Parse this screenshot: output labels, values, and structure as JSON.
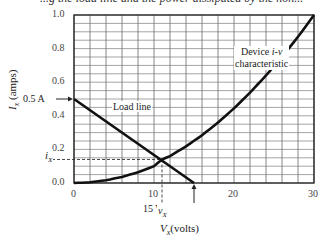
{
  "caption_fragment": "...g the load line and the power dissipated by the non...",
  "chart_data": {
    "type": "line",
    "title": "",
    "xlabel": "V_x (volts)",
    "ylabel": "I_x (amps)",
    "xlim": [
      0,
      30
    ],
    "ylim": [
      0,
      1.0
    ],
    "x_ticks": [
      "0",
      "10",
      "20",
      "30"
    ],
    "y_ticks": [
      "0.0",
      "0.2",
      "0.4",
      "0.6",
      "0.8",
      "1.0"
    ],
    "grid": true,
    "grid_x_step": 2,
    "grid_y_step": 0.05,
    "series": [
      {
        "name": "Load line",
        "x": [
          0,
          15
        ],
        "y": [
          0.5,
          0.0
        ]
      },
      {
        "name": "Device i-v characteristic",
        "x": [
          0,
          2,
          4,
          6,
          8,
          10,
          11,
          12,
          14,
          16,
          18,
          20,
          22,
          24,
          26,
          28,
          30
        ],
        "y": [
          0.0,
          0.004,
          0.016,
          0.036,
          0.064,
          0.1,
          0.14,
          0.16,
          0.218,
          0.284,
          0.36,
          0.444,
          0.538,
          0.64,
          0.75,
          0.87,
          1.0
        ]
      }
    ],
    "annotations": [
      {
        "text": "0.5 A",
        "x": 0,
        "y": 0.5,
        "arrow": true
      },
      {
        "text": "15 V",
        "x": 15,
        "y": 0.0,
        "arrow": true
      },
      {
        "text": "Load line",
        "x": 4,
        "y": 0.41
      },
      {
        "text": "Device i-v characteristic",
        "x": 24,
        "y": 0.81
      },
      {
        "text": "i_X",
        "x": 0,
        "y": 0.14,
        "dashed_guide": true
      },
      {
        "text": "v_X",
        "x": 11,
        "y": 0.0,
        "dashed_guide": true
      }
    ],
    "operating_point": {
      "v_X": 11,
      "i_X": 0.14
    }
  },
  "labels": {
    "ylabel_main": "I",
    "ylabel_sub": "x",
    "ylabel_rest": " (amps)",
    "xlabel_main": "V",
    "xlabel_sub": "x",
    "xlabel_rest": "(volts)",
    "load_line": "Load line",
    "device_line1_a": "Device ",
    "device_line1_b": "i-v",
    "device_line2": "characteristic",
    "arrow_current": "0.5 A",
    "arrow_voltage": "15 V",
    "ix_main": "i",
    "ix_sub": "X",
    "vx_main": "v",
    "vx_sub": "X"
  }
}
